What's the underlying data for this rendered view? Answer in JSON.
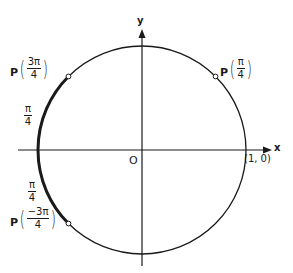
{
  "diagram": {
    "type": "unit-circle",
    "center": {
      "x": 142,
      "y": 150
    },
    "radius": 104,
    "colors": {
      "ink": "#1a1a1a",
      "background": "#ffffff"
    },
    "axes": {
      "x_label": "x",
      "y_label": "y",
      "origin_label": "O",
      "intercept_label": "(1, 0)"
    },
    "points": [
      {
        "id": "p-pi-4",
        "prefix": "P",
        "num": "π",
        "den": "4",
        "angle_deg": 45
      },
      {
        "id": "p-3pi-4",
        "prefix": "P",
        "num": "3π",
        "den": "4",
        "angle_deg": 135
      },
      {
        "id": "p-neg3pi-4",
        "prefix": "P",
        "num": "−3π",
        "den": "4",
        "angle_deg": -135
      }
    ],
    "arc_labels": [
      {
        "num": "π",
        "den": "4",
        "position": "upper-left arc"
      },
      {
        "num": "π",
        "den": "4",
        "position": "lower-left arc"
      }
    ]
  }
}
